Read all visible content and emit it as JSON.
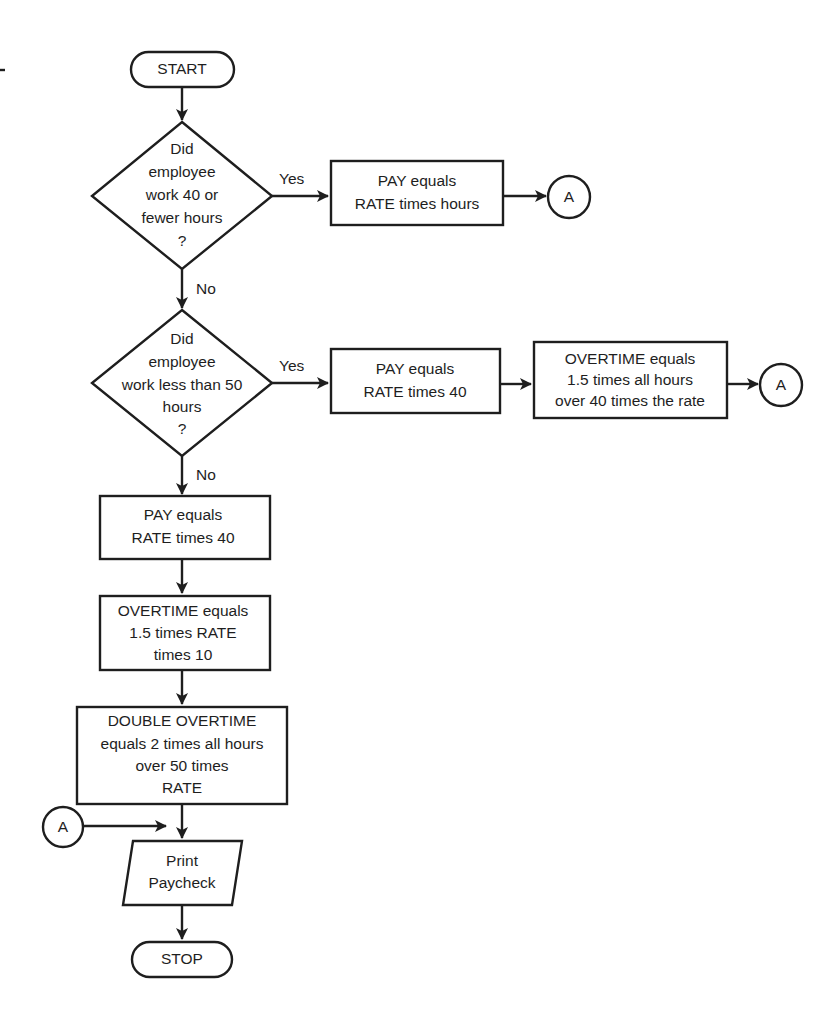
{
  "diagram": {
    "type": "flowchart",
    "colors": {
      "stroke": "#1e1e1e",
      "background": "#ffffff",
      "text": "#1e1e1e"
    },
    "start": {
      "label": "START"
    },
    "decision1": {
      "lines": [
        "Did",
        "employee",
        "work 40 or",
        "fewer hours",
        "?"
      ],
      "yes_label": "Yes",
      "no_label": "No"
    },
    "pay_rate_hours": {
      "lines": [
        "PAY equals",
        "RATE times hours"
      ]
    },
    "connector_a1": {
      "label": "A"
    },
    "decision2": {
      "lines": [
        "Did",
        "employee",
        "work less than 50",
        "hours",
        "?"
      ],
      "yes_label": "Yes",
      "no_label": "No"
    },
    "pay_rate_40_right": {
      "lines": [
        "PAY equals",
        "RATE times 40"
      ]
    },
    "overtime_right": {
      "lines": [
        "OVERTIME equals",
        "1.5 times all hours",
        "over 40 times the rate"
      ]
    },
    "connector_a2": {
      "label": "A"
    },
    "pay_rate_40_left": {
      "lines": [
        "PAY equals",
        "RATE times 40"
      ]
    },
    "overtime_left": {
      "lines": [
        "OVERTIME equals",
        "1.5 times RATE",
        "times 10"
      ]
    },
    "double_overtime": {
      "lines": [
        "DOUBLE OVERTIME",
        "equals 2 times all hours",
        "over 50 times",
        "RATE"
      ]
    },
    "connector_a3": {
      "label": "A"
    },
    "print": {
      "lines": [
        "Print",
        "Paycheck"
      ]
    },
    "stop": {
      "label": "STOP"
    }
  }
}
